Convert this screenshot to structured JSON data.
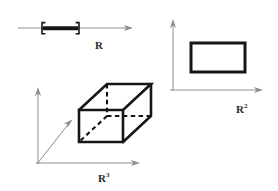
{
  "figure": {
    "width": 278,
    "height": 191,
    "background_color": "#ffffff",
    "ink_color": "#161616",
    "axis_color": "#8d8d8d",
    "label_color": "#2a2a2a"
  },
  "panels": {
    "r1": {
      "label_base": "R",
      "label_exponent": "",
      "description": "number line with closed interval drawn as a thick bar with square brackets",
      "axis": {
        "type": "horizontal-arrow",
        "x_start": 18,
        "x_end": 133,
        "y": 28
      },
      "interval": {
        "kind": "closed",
        "left_bracket": "[",
        "right_bracket": "]",
        "x_left": 42,
        "x_right": 79,
        "y": 28
      },
      "label_position": {
        "x": 99,
        "y": 48
      }
    },
    "r2": {
      "label_base": "R",
      "label_exponent": "2",
      "description": "two coordinate axes with a solid outlined rectangle",
      "axes": [
        {
          "name": "vertical-axis",
          "type": "vertical-arrow",
          "x": 173,
          "y_start": 90,
          "y_end": 20
        },
        {
          "name": "horizontal-axis",
          "type": "horizontal-arrow",
          "y": 90,
          "x_start": 170,
          "x_end": 262
        }
      ],
      "rectangle": {
        "x": 191,
        "y": 43,
        "width": 54,
        "height": 29
      },
      "label_position": {
        "x": 239,
        "y": 112
      }
    },
    "r3": {
      "label_base": "R",
      "label_exponent": "3",
      "description": "three coordinate axes with a rectangular box drawn in perspective, hidden edges dashed",
      "origin": {
        "x": 38,
        "y": 163
      },
      "axes": [
        {
          "name": "vertical-axis",
          "type": "vertical-arrow",
          "x": 38,
          "y_start": 163,
          "y_end": 88
        },
        {
          "name": "horizontal-axis",
          "type": "horizontal-arrow",
          "y": 163,
          "x_start": 38,
          "x_end": 140
        },
        {
          "name": "diagonal-axis",
          "type": "diagonal-arrow",
          "x_start": 38,
          "y_start": 163,
          "x_end": 72,
          "y_end": 120
        }
      ],
      "box": {
        "front_face": {
          "x": 79,
          "y": 110,
          "width": 44,
          "height": 32
        },
        "depth_offset": {
          "dx": 28,
          "dy": -26
        },
        "hidden_edges": 3,
        "visible_edges": 9
      },
      "label_position": {
        "x": 101,
        "y": 181
      }
    }
  }
}
